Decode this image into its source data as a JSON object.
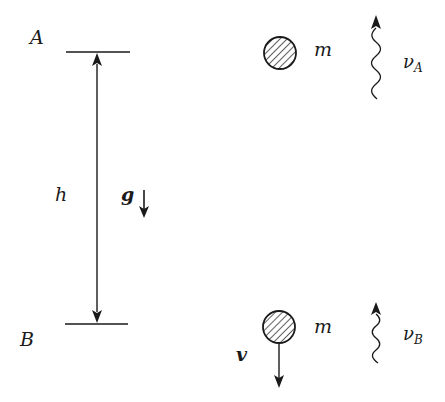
{
  "diagram": {
    "levels": {
      "top_label": "A",
      "bottom_label": "B",
      "height_label": "h"
    },
    "gravity": {
      "label": "g",
      "direction": "down"
    },
    "masses": [
      {
        "position": "A",
        "label": "m",
        "velocity_label": ""
      },
      {
        "position": "B",
        "label": "m",
        "velocity_label": "v",
        "velocity_direction": "down"
      }
    ],
    "photons": [
      {
        "position": "A",
        "symbol": "ν",
        "subscript": "A",
        "direction": "up"
      },
      {
        "position": "B",
        "symbol": "ν",
        "subscript": "B",
        "direction": "up"
      }
    ],
    "colors": {
      "ink": "#1a1a1a",
      "background": "#ffffff"
    }
  }
}
